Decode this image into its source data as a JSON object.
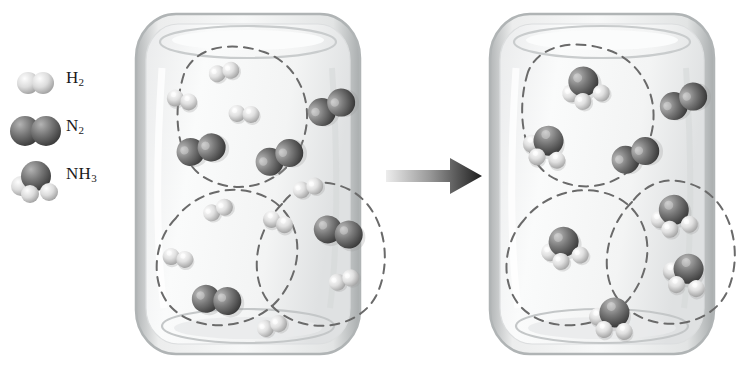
{
  "figure": {
    "background": "#ffffff",
    "width": 738,
    "height": 379
  },
  "legend": {
    "items": [
      {
        "icon": "h2-molecule-icon",
        "label": "H",
        "sub": "2",
        "formula": "H2",
        "name": "hydrogen",
        "atoms": [
          {
            "element": "H",
            "color": "#d9d9d9"
          },
          {
            "element": "H",
            "color": "#d9d9d9"
          }
        ]
      },
      {
        "icon": "n2-molecule-icon",
        "label": "N",
        "sub": "2",
        "formula": "N2",
        "name": "nitrogen",
        "atoms": [
          {
            "element": "N",
            "color": "#6e6e6e"
          },
          {
            "element": "N",
            "color": "#6e6e6e"
          }
        ]
      },
      {
        "icon": "nh3-molecule-icon",
        "label": "NH",
        "sub": "3",
        "formula": "NH3",
        "name": "ammonia",
        "atoms": [
          {
            "element": "N",
            "color": "#6e6e6e"
          },
          {
            "element": "H",
            "color": "#d9d9d9"
          },
          {
            "element": "H",
            "color": "#d9d9d9"
          },
          {
            "element": "H",
            "color": "#d9d9d9"
          }
        ]
      }
    ]
  },
  "colors": {
    "hydrogen_atom": "#dedede",
    "hydrogen_atom_shadow": "#a8a8a8",
    "nitrogen_atom": "#717171",
    "nitrogen_atom_shadow": "#3e3e3e",
    "glass_wall": "#b9bcbd",
    "glass_fill": "#f2f3f3",
    "dashed_group": "#6a6a6a",
    "arrow_dark": "#1d1d1d",
    "arrow_light": "#e8e8e8",
    "text": "#1a1a1a"
  },
  "reaction": {
    "equation": "N2 + 3 H2 -> 2 NH3",
    "arrow": "reaction-arrow-right",
    "direction": "left-to-right"
  },
  "left_vessel": {
    "name": "reactants-container",
    "caption": "before reaction",
    "grouped_sets": 3,
    "per_group": {
      "N2": 1,
      "H2": 3
    },
    "totals": {
      "N2": 5,
      "H2": 9,
      "NH3": 0
    },
    "excess_outside_groups": {
      "N2": 2
    },
    "groups": [
      {
        "id": "group-1",
        "path": "M 52 66 C 40 104 44 150 70 168 C 104 190 150 178 168 140 C 186 100 168 56 132 44 C 96 32 62 40 52 66 Z",
        "molecules": [
          {
            "type": "H2",
            "x": 92,
            "y": 64,
            "rot": -14
          },
          {
            "type": "H2",
            "x": 50,
            "y": 92,
            "rot": 16
          },
          {
            "type": "H2",
            "x": 112,
            "y": 106,
            "rot": 4
          },
          {
            "type": "N2",
            "x": 68,
            "y": 140,
            "rot": -34
          }
        ]
      },
      {
        "id": "group-2",
        "path": "M 44 210 C 20 234 18 278 40 300 C 66 326 120 322 146 292 C 176 256 170 208 136 190 C 100 172 62 186 44 210 Z",
        "molecules": [
          {
            "type": "H2",
            "x": 86,
            "y": 202,
            "rot": -24
          },
          {
            "type": "H2",
            "x": 46,
            "y": 250,
            "rot": 12
          },
          {
            "type": "N2",
            "x": 84,
            "y": 290,
            "rot": -16
          },
          {
            "type": "H2",
            "x": 140,
            "y": 318,
            "rot": -20
          }
        ]
      },
      {
        "id": "group-3",
        "path": "M 150 196 C 120 226 116 276 142 300 C 172 328 226 322 244 288 C 262 252 252 200 218 182 C 186 166 164 178 150 196 Z",
        "molecules": [
          {
            "type": "H2",
            "x": 176,
            "y": 180,
            "rot": -16
          },
          {
            "type": "H2",
            "x": 146,
            "y": 214,
            "rot": 22
          },
          {
            "type": "N2",
            "x": 206,
            "y": 222,
            "rot": -8
          },
          {
            "type": "H2",
            "x": 212,
            "y": 272,
            "rot": -18
          }
        ]
      }
    ],
    "free_molecules": [
      {
        "type": "N2",
        "x": 198,
        "y": 98,
        "rot": -48
      },
      {
        "type": "N2",
        "x": 146,
        "y": 148,
        "rot": -46
      }
    ]
  },
  "right_vessel": {
    "name": "products-container",
    "caption": "after reaction",
    "grouped_sets": 3,
    "per_group": {
      "NH3": 2
    },
    "totals": {
      "NH3": 6,
      "N2": 2,
      "H2": 0
    },
    "excess_outside_groups": {
      "N2": 2
    },
    "groups": [
      {
        "id": "group-1",
        "path": "M 42 64 C 30 102 36 150 64 168 C 100 190 146 176 162 136 C 178 96 158 54 122 42 C 86 30 52 38 42 64 Z",
        "molecules": [
          {
            "type": "NH3",
            "x": 96,
            "y": 76,
            "rot": -16
          },
          {
            "type": "NH3",
            "x": 60,
            "y": 134,
            "rot": 18
          }
        ]
      },
      {
        "id": "group-2",
        "path": "M 38 212 C 16 236 14 278 36 300 C 62 326 116 322 142 292 C 172 256 166 208 132 190 C 96 172 56 188 38 212 Z",
        "molecules": [
          {
            "type": "NH3",
            "x": 76,
            "y": 236,
            "rot": -10
          },
          {
            "type": "NH3",
            "x": 126,
            "y": 306,
            "rot": 14
          }
        ]
      },
      {
        "id": "group-3",
        "path": "M 146 194 C 116 224 112 274 138 298 C 168 326 222 320 240 286 C 258 250 248 198 214 180 C 182 164 160 176 146 194 Z",
        "molecules": [
          {
            "type": "NH3",
            "x": 186,
            "y": 204,
            "rot": -6
          },
          {
            "type": "NH3",
            "x": 200,
            "y": 262,
            "rot": 20
          }
        ]
      }
    ],
    "free_molecules": [
      {
        "type": "N2",
        "x": 196,
        "y": 92,
        "rot": -48
      },
      {
        "type": "N2",
        "x": 148,
        "y": 146,
        "rot": -46
      }
    ]
  }
}
